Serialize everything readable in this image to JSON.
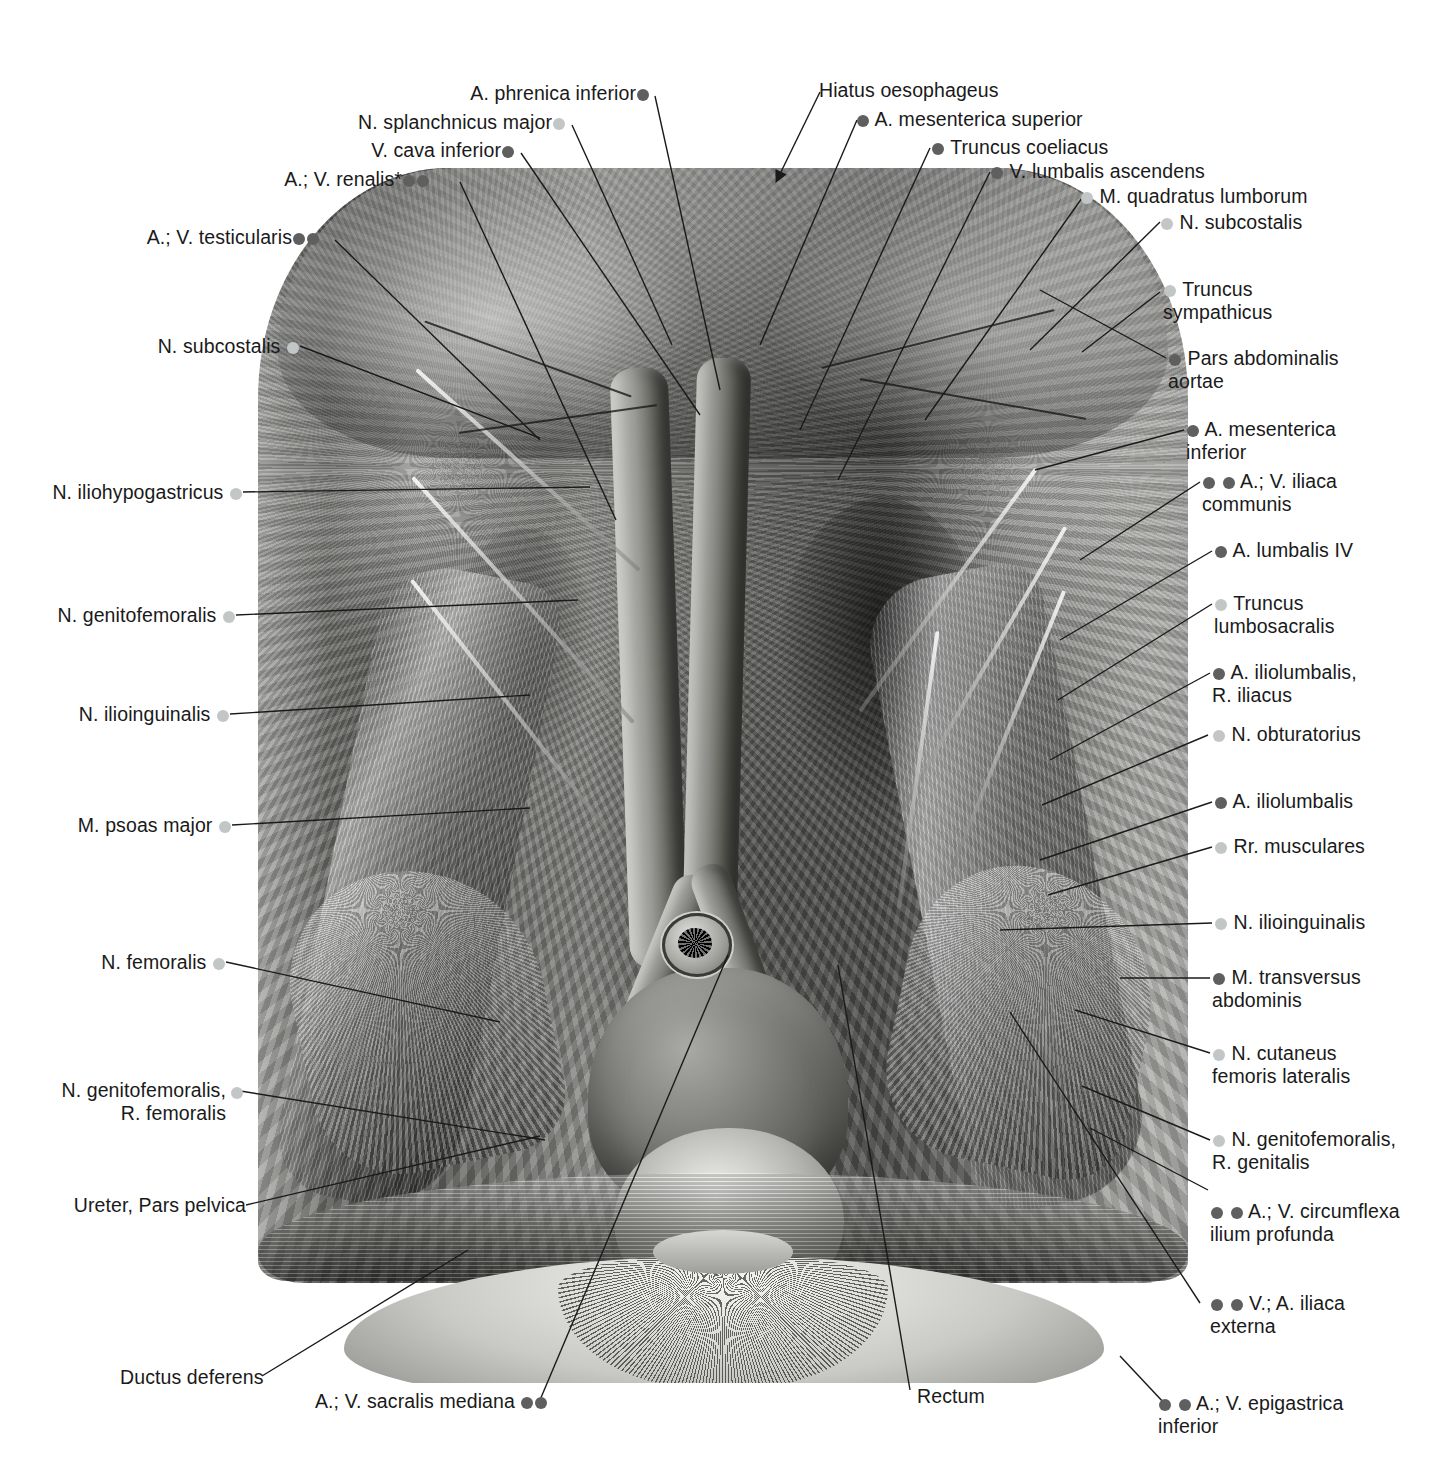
{
  "figure": {
    "legend": {
      "dark_dot_color": "#5f5f5f",
      "light_dot_color": "#c3c6c6",
      "dark_dot_meaning": "blood vessel",
      "light_dot_meaning": "nerve / muscle"
    },
    "footnote_marker": "*"
  },
  "labels_top": [
    {
      "id": "a-phrenica-inferior",
      "text": "A. phrenica inferior",
      "dots": [
        "dark"
      ],
      "dot_side": "after",
      "align": "right"
    },
    {
      "id": "n-splanchnicus-major",
      "text": "N. splanchnicus major",
      "dots": [
        "light"
      ],
      "dot_side": "after",
      "align": "right"
    },
    {
      "id": "v-cava-inferior",
      "text": "V. cava inferior",
      "dots": [
        "dark"
      ],
      "dot_side": "after",
      "align": "right"
    },
    {
      "id": "a-v-renalis",
      "text": "A.; V. renalis*",
      "dots": [
        "dark",
        "dark"
      ],
      "dot_side": "after",
      "align": "right"
    },
    {
      "id": "a-v-testicularis",
      "text": "A.; V. testicularis",
      "dots": [
        "dark",
        "dark"
      ],
      "dot_side": "after",
      "align": "right"
    },
    {
      "id": "hiatus-oesophageus",
      "text": "Hiatus oesophageus",
      "dots": [],
      "dot_side": "none",
      "align": "left"
    },
    {
      "id": "a-mesenterica-superior",
      "text": "A. mesenterica superior",
      "dots": [
        "dark"
      ],
      "dot_side": "before",
      "align": "left"
    },
    {
      "id": "truncus-coeliacus",
      "text": "Truncus coeliacus",
      "dots": [
        "dark"
      ],
      "dot_side": "before",
      "align": "left"
    },
    {
      "id": "v-lumbalis-ascendens",
      "text": "V. lumbalis ascendens",
      "dots": [
        "dark"
      ],
      "dot_side": "before",
      "align": "left"
    },
    {
      "id": "m-quadratus-lumborum",
      "text": "M. quadratus lumborum",
      "dots": [
        "light"
      ],
      "dot_side": "before",
      "align": "left"
    },
    {
      "id": "n-subcostalis-right",
      "text": "N. subcostalis",
      "dots": [
        "light"
      ],
      "dot_side": "before",
      "align": "left"
    }
  ],
  "labels_left": [
    {
      "id": "n-subcostalis-left",
      "text": "N. subcostalis",
      "dots": [
        "light"
      ],
      "dot_side": "after",
      "align": "right"
    },
    {
      "id": "n-iliohypogastricus",
      "text": "N. iliohypogastricus",
      "dots": [
        "light"
      ],
      "dot_side": "after",
      "align": "right"
    },
    {
      "id": "n-genitofemoralis",
      "text": "N. genitofemoralis",
      "dots": [
        "light"
      ],
      "dot_side": "after",
      "align": "right"
    },
    {
      "id": "n-ilioinguinalis-left",
      "text": "N. ilioinguinalis",
      "dots": [
        "light"
      ],
      "dot_side": "after",
      "align": "right"
    },
    {
      "id": "m-psoas-major",
      "text": "M. psoas major",
      "dots": [
        "light"
      ],
      "dot_side": "after",
      "align": "right"
    },
    {
      "id": "n-femoralis",
      "text": "N. femoralis",
      "dots": [
        "light"
      ],
      "dot_side": "after",
      "align": "right"
    },
    {
      "id": "n-genitofemoralis-r-femoralis",
      "text": "N. genitofemoralis,\nR. femoralis",
      "dots": [
        "light"
      ],
      "dot_side": "after-first-line",
      "align": "right"
    },
    {
      "id": "ureter-pars-pelvica",
      "text": "Ureter, Pars pelvica",
      "dots": [],
      "dot_side": "none",
      "align": "right"
    }
  ],
  "labels_right": [
    {
      "id": "truncus-sympathicus",
      "text": "Truncus\nsympathicus",
      "dots": [
        "light"
      ],
      "dot_side": "before",
      "align": "left"
    },
    {
      "id": "pars-abdominalis-aortae",
      "text": "Pars abdominalis\naortae",
      "dots": [
        "dark"
      ],
      "dot_side": "before",
      "align": "left"
    },
    {
      "id": "a-mesenterica-inferior",
      "text": "A. mesenterica\ninferior",
      "dots": [
        "dark"
      ],
      "dot_side": "before",
      "align": "left"
    },
    {
      "id": "a-v-iliaca-communis",
      "text": "A.; V. iliaca\ncommunis",
      "dots": [
        "dark",
        "dark"
      ],
      "dot_side": "before",
      "align": "left"
    },
    {
      "id": "a-lumbalis-iv",
      "text": "A. lumbalis IV",
      "dots": [
        "dark"
      ],
      "dot_side": "before",
      "align": "left"
    },
    {
      "id": "truncus-lumbosacralis",
      "text": "Truncus\nlumbosacralis",
      "dots": [
        "light"
      ],
      "dot_side": "before",
      "align": "left"
    },
    {
      "id": "a-iliolumbalis-r-iliacus",
      "text": "A. iliolumbalis,\nR. iliacus",
      "dots": [
        "dark"
      ],
      "dot_side": "before",
      "align": "left"
    },
    {
      "id": "n-obturatorius",
      "text": "N. obturatorius",
      "dots": [
        "light"
      ],
      "dot_side": "before",
      "align": "left"
    },
    {
      "id": "a-iliolumbalis",
      "text": "A. iliolumbalis",
      "dots": [
        "dark"
      ],
      "dot_side": "before",
      "align": "left"
    },
    {
      "id": "rr-musculares",
      "text": "Rr. musculares",
      "dots": [
        "light"
      ],
      "dot_side": "before",
      "align": "left"
    },
    {
      "id": "n-ilioinguinalis-right",
      "text": "N. ilioinguinalis",
      "dots": [
        "light"
      ],
      "dot_side": "before",
      "align": "left"
    },
    {
      "id": "m-transversus-abdominis",
      "text": "M. transversus\nabdominis",
      "dots": [
        "dark"
      ],
      "dot_side": "before",
      "align": "left"
    },
    {
      "id": "n-cutaneus-femoris-lateralis",
      "text": "N. cutaneus\nfemoris lateralis",
      "dots": [
        "light"
      ],
      "dot_side": "before",
      "align": "left"
    },
    {
      "id": "n-genitofemoralis-r-genitalis",
      "text": "N. genitofemoralis,\nR. genitalis",
      "dots": [
        "light"
      ],
      "dot_side": "before",
      "align": "left"
    },
    {
      "id": "a-v-circumflexa-ilium-profunda",
      "text": "A.; V. circumflexa\nilium profunda",
      "dots": [
        "dark",
        "dark"
      ],
      "dot_side": "before",
      "align": "left"
    },
    {
      "id": "v-a-iliaca-externa",
      "text": "V.; A. iliaca\nexterna",
      "dots": [
        "dark",
        "dark"
      ],
      "dot_side": "before",
      "align": "left"
    },
    {
      "id": "a-v-epigastrica-inferior",
      "text": "A.; V. epigastrica\ninferior",
      "dots": [
        "dark",
        "dark"
      ],
      "dot_side": "before",
      "align": "left"
    }
  ],
  "labels_bottom": [
    {
      "id": "ductus-deferens",
      "text": "Ductus deferens",
      "dots": [],
      "dot_side": "none",
      "align": "left"
    },
    {
      "id": "a-v-sacralis-mediana",
      "text": "A.; V. sacralis mediana",
      "dots": [
        "dark",
        "dark"
      ],
      "dot_side": "after",
      "align": "left"
    },
    {
      "id": "rectum",
      "text": "Rectum",
      "dots": [],
      "dot_side": "none",
      "align": "left"
    }
  ]
}
